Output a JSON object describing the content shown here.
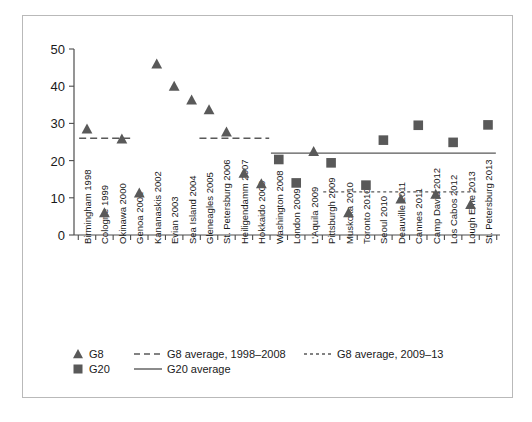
{
  "chart_data": {
    "type": "scatter",
    "title": "",
    "subtitle": "",
    "xlabel": "",
    "ylabel": "",
    "ylim": [
      0,
      50
    ],
    "yticks": [
      0,
      10,
      20,
      30,
      40,
      50
    ],
    "grid": false,
    "legend_position": "bottom-left",
    "categories": [
      "Birmingham 1998",
      "Cologne 1999",
      "Okinawa 2000",
      "Genoa 2001",
      "Kananaskis 2002",
      "Evian 2003",
      "Sea Island 2004",
      "Gleneagles 2005",
      "St. Petersburg 2006",
      "Heiligendamm 2007",
      "Hokkaido 2008",
      "Washington 2008",
      "London 2009",
      "L'Aquila 2009",
      "Pittsburgh 2009",
      "Muskoka 2010",
      "Toronto 2010",
      "Seoul 2010",
      "Deauville 2011",
      "Cannes 2011",
      "Camp David 2012",
      "Los Cabos 2012",
      "Lough Erne 2013",
      "St. Petersburg 2013"
    ],
    "series": [
      {
        "name": "G8",
        "marker": "triangle",
        "color": "#595959",
        "points": [
          {
            "category": "Birmingham 1998",
            "value": 28.5
          },
          {
            "category": "Cologne 1999",
            "value": 6.0
          },
          {
            "category": "Okinawa 2000",
            "value": 25.8
          },
          {
            "category": "Genoa 2001",
            "value": 11.3
          },
          {
            "category": "Kananaskis 2002",
            "value": 46.0
          },
          {
            "category": "Evian 2003",
            "value": 40.0
          },
          {
            "category": "Sea Island 2004",
            "value": 36.3
          },
          {
            "category": "Gleneagles 2005",
            "value": 33.7
          },
          {
            "category": "St. Petersburg 2006",
            "value": 27.7
          },
          {
            "category": "Heiligendamm 2007",
            "value": 16.6
          },
          {
            "category": "Hokkaido 2008",
            "value": 13.8
          },
          {
            "category": "L'Aquila 2009",
            "value": 22.5
          },
          {
            "category": "Muskoka 2010",
            "value": 6.0
          },
          {
            "category": "Deauville 2011",
            "value": 9.7
          },
          {
            "category": "Camp David 2012",
            "value": 11.0
          },
          {
            "category": "Lough Erne 2013",
            "value": 8.2
          }
        ]
      },
      {
        "name": "G20",
        "marker": "square",
        "color": "#595959",
        "points": [
          {
            "category": "Washington 2008",
            "value": 20.3
          },
          {
            "category": "London 2009",
            "value": 14.0
          },
          {
            "category": "Pittsburgh 2009",
            "value": 19.4
          },
          {
            "category": "Toronto 2010",
            "value": 13.4
          },
          {
            "category": "Seoul 2010",
            "value": 25.5
          },
          {
            "category": "Cannes 2011",
            "value": 29.5
          },
          {
            "category": "Los Cabos 2012",
            "value": 24.9
          },
          {
            "category": "St. Petersburg 2013",
            "value": 29.6
          }
        ]
      }
    ],
    "reference_lines": [
      {
        "name": "G8 average, 1998–2008",
        "value": 26.0,
        "style": "dashed",
        "color": "#595959",
        "span_categories": [
          "Birmingham 1998",
          "Hokkaido 2008"
        ],
        "break_categories": [
          "Genoa 2001",
          "Sea Island 2004"
        ]
      },
      {
        "name": "G20 average",
        "value": 22.0,
        "style": "solid",
        "color": "#595959",
        "span_categories": [
          "Washington 2008",
          "St. Petersburg 2013"
        ]
      },
      {
        "name": "G8 average, 2009–13",
        "value": 11.6,
        "style": "dotted-dashed",
        "color": "#595959",
        "span_categories": [
          "Pittsburgh 2009",
          "Lough Erne 2013"
        ]
      }
    ]
  },
  "legend": {
    "entries": [
      {
        "id": "g8-marker",
        "label": "G8",
        "symbol": "triangle"
      },
      {
        "id": "g8-avg-1998-2008",
        "label": "G8 average, 1998–2008",
        "symbol": "dashed-line"
      },
      {
        "id": "g8-avg-2009-13",
        "label": "G8 average, 2009–13",
        "symbol": "fine-dashed-line"
      },
      {
        "id": "g20-marker",
        "label": "G20",
        "symbol": "square"
      },
      {
        "id": "g20-avg",
        "label": "G20 average",
        "symbol": "solid-line"
      }
    ]
  },
  "axis": {
    "y_tick_labels": [
      "0",
      "10",
      "20",
      "30",
      "40",
      "50"
    ]
  },
  "colors": {
    "marker": "#595959",
    "axis": "#4d4d4d",
    "text": "#1a1a1a",
    "frame": "#b9b9b9",
    "background": "#ffffff"
  }
}
